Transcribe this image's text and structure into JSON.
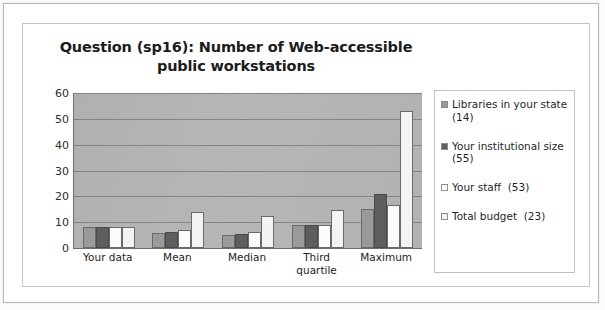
{
  "chart_data": {
    "type": "bar",
    "title": "Question (sp16): Number of Web-accessible public workstations",
    "xlabel": "",
    "ylabel": "",
    "ylim": [
      0,
      60
    ],
    "yticks": [
      60,
      50,
      40,
      30,
      20,
      10,
      0
    ],
    "grid": true,
    "legend_position": "right",
    "categories": [
      "Your data",
      "Mean",
      "Median",
      "Third quartile",
      "Maximum"
    ],
    "series": [
      {
        "name": "Libraries in your state  (14)",
        "label_line1": "Libraries in your state",
        "label_line2": "(14)",
        "color": "#9a9a9a",
        "values": [
          8,
          6,
          5,
          9,
          15
        ]
      },
      {
        "name": "Your institutional size  (55)",
        "label_line1": "Your institutional size",
        "label_line2": "(55)",
        "color": "#5e5e5e",
        "values": [
          8,
          6.3,
          5.5,
          9,
          21
        ]
      },
      {
        "name": "Your staff  (53)",
        "label_line1": "Your staff  (53)",
        "label_line2": "",
        "color": "#fbfbfb",
        "values": [
          8,
          6.8,
          6.2,
          8.8,
          16.8
        ]
      },
      {
        "name": "Total budget  (23)",
        "label_line1": "Total budget  (23)",
        "label_line2": "",
        "color": "#f3f3f1",
        "values": [
          8.3,
          13.8,
          12.5,
          14.9,
          53
        ]
      }
    ]
  }
}
